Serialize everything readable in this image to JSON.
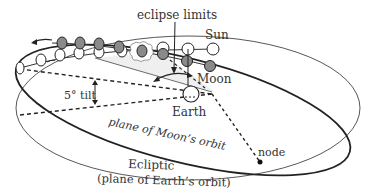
{
  "diagram": {
    "labels": {
      "eclipse_limits": "eclipse limits",
      "sun": "Sun",
      "moon": "Moon",
      "earth": "Earth",
      "tilt": "5° tilt",
      "moon_plane": "plane of Moon’s orbit",
      "node": "node",
      "ecliptic": "Ecliptic",
      "ecliptic_sub": "(plane of Earth’s orbit)"
    },
    "colors": {
      "line": "#2a2a2a",
      "moon_fill": "#8a8a8a",
      "shade": "#eeeeee",
      "text": "#333333"
    },
    "moon_positions": [
      {
        "cx": 62,
        "cy": 43
      },
      {
        "cx": 80,
        "cy": 43
      },
      {
        "cx": 99,
        "cy": 44
      },
      {
        "cx": 119,
        "cy": 47
      },
      {
        "cx": 142,
        "cy": 51
      },
      {
        "cx": 163,
        "cy": 54
      },
      {
        "cx": 187,
        "cy": 61
      },
      {
        "cx": 210,
        "cy": 66
      }
    ],
    "sun_positions": [
      {
        "cx": 20,
        "cy": 68
      },
      {
        "cx": 41,
        "cy": 60
      },
      {
        "cx": 60,
        "cy": 55
      },
      {
        "cx": 79,
        "cy": 53
      },
      {
        "cx": 99,
        "cy": 52
      },
      {
        "cx": 122,
        "cy": 51
      },
      {
        "cx": 163,
        "cy": 48
      },
      {
        "cx": 188,
        "cy": 49
      },
      {
        "cx": 213,
        "cy": 49
      }
    ]
  }
}
